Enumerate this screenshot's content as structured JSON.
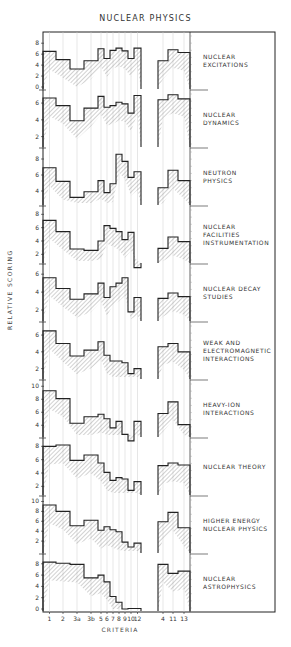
{
  "title": "NUCLEAR PHYSICS",
  "ylabel": "RELATIVE SCORING",
  "xlabel": "CRITERIA",
  "colors": {
    "line": "#222222",
    "hatch": "#777777",
    "grid": "#cccccc",
    "background": "#ffffff"
  },
  "chart_data": {
    "type": "bar",
    "title": "NUCLEAR PHYSICS",
    "xlabel": "CRITERIA",
    "ylabel": "RELATIVE SCORING",
    "categories": [
      "1",
      "2",
      "3a",
      "3b",
      "5",
      "6",
      "7",
      "8",
      "9",
      "10",
      "12",
      "4",
      "11",
      "13"
    ],
    "groups": [
      [
        "1",
        "2",
        "3a",
        "3b",
        "5",
        "6",
        "7",
        "8",
        "9",
        "10",
        "12"
      ],
      [
        "4",
        "11",
        "13"
      ]
    ],
    "style": "stepped histogram with hatched uncertainty band, stacked panels",
    "series": [
      {
        "name": "NUCLEAR EXCITATIONS",
        "label_lines": [
          "NUCLEAR",
          "EXCITATIONS"
        ],
        "yticks": [
          0,
          2,
          4,
          6,
          8
        ],
        "ymin": 0,
        "ymax": 9.5,
        "values": [
          6.5,
          5.0,
          3.3,
          4.8,
          7.0,
          5.2,
          6.7,
          7.1,
          6.6,
          5.2,
          7.1,
          4.8,
          6.8,
          6.3
        ]
      },
      {
        "name": "NUCLEAR DYNAMICS",
        "label_lines": [
          "NUCLEAR",
          "DYNAMICS"
        ],
        "yticks": [
          2,
          4,
          6
        ],
        "ymin": 1,
        "ymax": 7.2,
        "values": [
          6.6,
          5.7,
          3.9,
          5.4,
          6.8,
          5.5,
          5.7,
          6.1,
          5.9,
          4.8,
          6.9,
          6.4,
          7.0,
          6.5
        ]
      },
      {
        "name": "NEUTRON PHYSICS",
        "label_lines": [
          "NEUTRON",
          "PHYSICS"
        ],
        "yticks": [
          4,
          6,
          8
        ],
        "ymin": 2.5,
        "ymax": 9,
        "values": [
          6.9,
          5.2,
          3.2,
          3.9,
          5.3,
          3.8,
          4.9,
          8.6,
          7.7,
          5.7,
          6.4,
          4.4,
          6.6,
          5.3
        ]
      },
      {
        "name": "NUCLEAR FACILITIES INSTRUMENTATION",
        "label_lines": [
          "NUCLEAR",
          "FACILITIES",
          "INSTRUMENTATION"
        ],
        "yticks": [
          2,
          4,
          6,
          8
        ],
        "ymin": 1,
        "ymax": 8.8,
        "values": [
          7.1,
          5.4,
          2.8,
          2.6,
          4.0,
          6.3,
          5.9,
          5.4,
          4.2,
          5.3,
          0,
          2.9,
          4.6,
          3.9
        ]
      },
      {
        "name": "NUCLEAR DECAY STUDIES",
        "label_lines": [
          "NUCLEAR DECAY",
          "STUDIES"
        ],
        "yticks": [
          2,
          4,
          6
        ],
        "ymin": 1,
        "ymax": 6.8,
        "values": [
          5.6,
          4.4,
          3.2,
          3.8,
          5.0,
          3.4,
          4.6,
          5.0,
          5.6,
          1.8,
          3.4,
          3.3,
          3.9,
          3.5
        ]
      },
      {
        "name": "WEAK AND ELECTROMAGNETIC INTERACTIONS",
        "label_lines": [
          "WEAK AND",
          "ELECTROMAGNETIC",
          "INTERACTIONS"
        ],
        "yticks": [
          2,
          4,
          6
        ],
        "ymin": 1,
        "ymax": 7.2,
        "values": [
          6.5,
          5.0,
          3.5,
          4.2,
          5.2,
          3.6,
          2.9,
          2.9,
          2.7,
          1.4,
          2.0,
          4.6,
          5.0,
          4.0
        ]
      },
      {
        "name": "HEAVY-ION INTERACTIONS",
        "label_lines": [
          "HEAVY-ION",
          "INTERACTIONS"
        ],
        "yticks": [
          4,
          6,
          8,
          10
        ],
        "ymin": 2.5,
        "ymax": 10.5,
        "values": [
          9.3,
          8.1,
          4.3,
          5.3,
          5.7,
          5.0,
          3.6,
          4.6,
          2.6,
          1.6,
          4.6,
          5.8,
          7.6,
          4.1
        ]
      },
      {
        "name": "NUCLEAR THEORY",
        "label_lines": [
          "NUCLEAR THEORY"
        ],
        "yticks": [
          2,
          4,
          6,
          8
        ],
        "ymin": 1,
        "ymax": 8.8,
        "values": [
          8.0,
          8.2,
          5.9,
          6.7,
          5.5,
          4.1,
          2.9,
          3.3,
          3.1,
          1.4,
          2.7,
          5.1,
          5.5,
          5.2
        ]
      },
      {
        "name": "HIGHER ENERGY NUCLEAR PHYSICS",
        "label_lines": [
          "HIGHER ENERGY",
          "NUCLEAR PHYSICS"
        ],
        "yticks": [
          2,
          4,
          6,
          8,
          10
        ],
        "ymin": 0,
        "ymax": 10.5,
        "values": [
          9.3,
          8.0,
          5.1,
          6.2,
          4.2,
          4.9,
          4.3,
          3.9,
          1.8,
          0.8,
          1.6,
          5.9,
          7.8,
          4.7
        ]
      },
      {
        "name": "NUCLEAR ASTROPHYSICS",
        "label_lines": [
          "NUCLEAR",
          "ASTROPHYSICS"
        ],
        "yticks": [
          0,
          2,
          4,
          6,
          8
        ],
        "ymin": 0,
        "ymax": 9.2,
        "values": [
          8.3,
          8.1,
          7.9,
          5.5,
          6.0,
          4.8,
          2.2,
          1.2,
          0,
          0.1,
          0.1,
          7.9,
          6.3,
          6.7
        ]
      }
    ]
  }
}
